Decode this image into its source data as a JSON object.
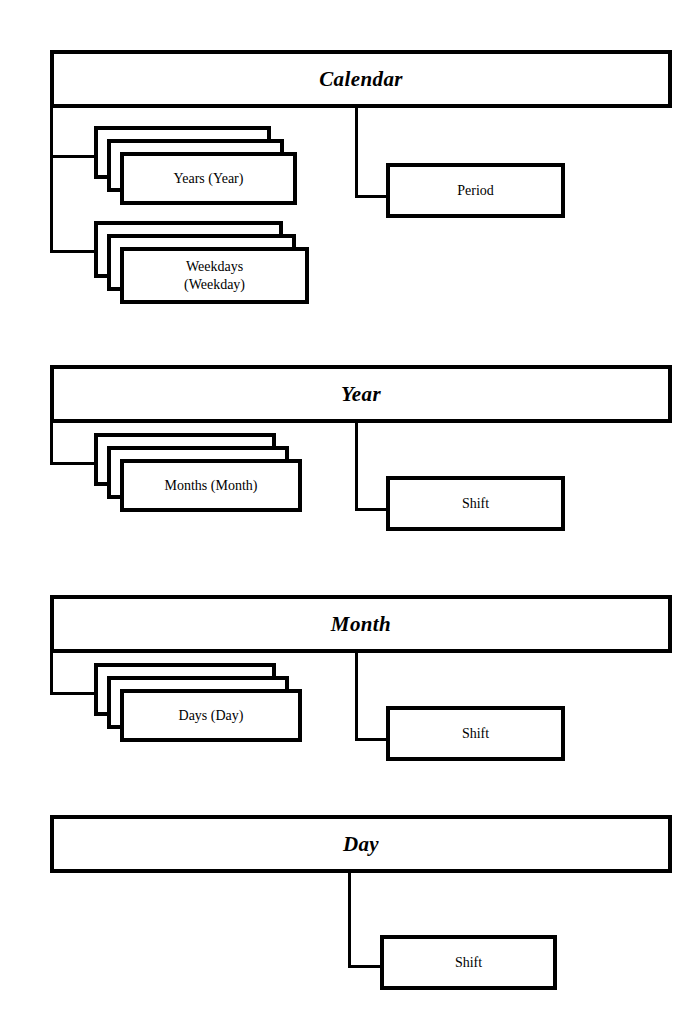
{
  "diagram": {
    "type": "uml-class-composition",
    "colors": {
      "stroke": "#000000",
      "fill": "#ffffff",
      "background": "#ffffff"
    }
  },
  "sections": [
    {
      "id": "calendar",
      "header": "Calendar",
      "children_multiple": [
        {
          "id": "years",
          "label": "Years (Year)"
        },
        {
          "id": "weekdays",
          "label": "Weekdays\n(Weekday)"
        }
      ],
      "children_single": [
        {
          "id": "period",
          "label": "Period"
        }
      ]
    },
    {
      "id": "year",
      "header": "Year",
      "children_multiple": [
        {
          "id": "months",
          "label": "Months (Month)"
        }
      ],
      "children_single": [
        {
          "id": "shift-year",
          "label": "Shift"
        }
      ]
    },
    {
      "id": "month",
      "header": "Month",
      "children_multiple": [
        {
          "id": "days",
          "label": "Days (Day)"
        }
      ],
      "children_single": [
        {
          "id": "shift-month",
          "label": "Shift"
        }
      ]
    },
    {
      "id": "day",
      "header": "Day",
      "children_multiple": [],
      "children_single": [
        {
          "id": "shift-day",
          "label": "Shift"
        }
      ]
    }
  ]
}
